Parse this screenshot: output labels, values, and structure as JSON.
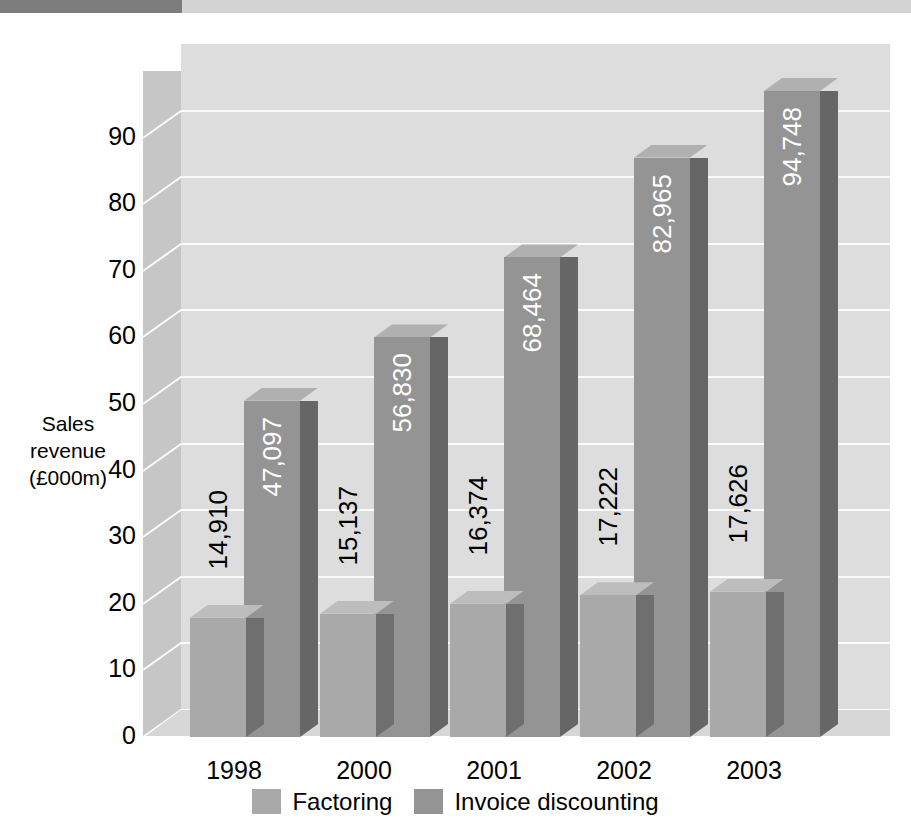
{
  "decor": {
    "band_dark_color": "#7d7d7d",
    "band_light_color": "#d3d3d3"
  },
  "axis": {
    "y_title_line1": "Sales",
    "y_title_line2": "revenue",
    "y_title_line3": "(£000m)",
    "y_ticks": [
      "90",
      "80",
      "70",
      "60",
      "50",
      "40",
      "30",
      "20",
      "10",
      "0"
    ]
  },
  "legend": {
    "items": [
      {
        "label": "Factoring",
        "color": "#a9a9a9"
      },
      {
        "label": "Invoice discounting",
        "color": "#949494"
      }
    ]
  },
  "chart_data": {
    "type": "bar",
    "title": "",
    "xlabel": "",
    "ylabel": "Sales revenue (£000m)",
    "ylim": [
      0,
      100
    ],
    "ytick_values": [
      0,
      10,
      20,
      30,
      40,
      50,
      60,
      70,
      80,
      90
    ],
    "grid": true,
    "legend_position": "bottom",
    "categories": [
      "1998",
      "2000",
      "2001",
      "2002",
      "2003"
    ],
    "series": [
      {
        "name": "Factoring",
        "color": "#a9a9a9",
        "values": [
          14910,
          15137,
          16374,
          17222,
          17626
        ],
        "plot_units": [
          17.9,
          18.5,
          20.0,
          21.3,
          21.8
        ],
        "labels": [
          "14,910",
          "15,137",
          "16,374",
          "17,222",
          "17,626"
        ],
        "label_color": "#000000",
        "label_placement": "outside"
      },
      {
        "name": "Invoice discounting",
        "color": "#949494",
        "values": [
          47097,
          56830,
          68464,
          82965,
          94748
        ],
        "plot_units": [
          50.5,
          60.0,
          72.0,
          87.0,
          97.0
        ],
        "labels": [
          "47,097",
          "56,830",
          "68,464",
          "82,965",
          "94,748"
        ],
        "label_color": "#ffffff",
        "label_placement": "inside"
      }
    ]
  }
}
